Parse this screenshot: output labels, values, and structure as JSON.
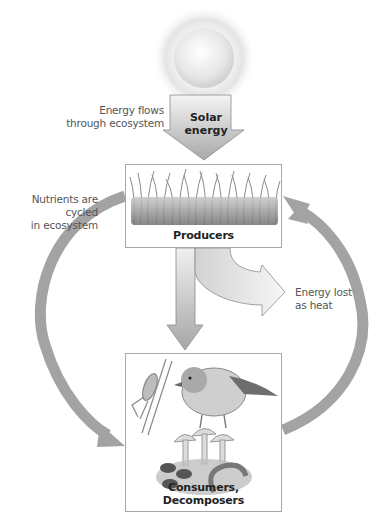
{
  "diagram": {
    "sun": {
      "icon": "sun-icon",
      "label": "Solar\nenergy",
      "label_line1": "Solar",
      "label_line2": "energy"
    },
    "annotations": {
      "energy_flows_line1": "Energy flows",
      "energy_flows_line2": "through ecosystem",
      "nutrients_line1": "Nutrients are cycled",
      "nutrients_line2": "in ecosystem",
      "heat_line1": "Energy lost",
      "heat_line2": "as heat"
    },
    "nodes": {
      "producers": {
        "label": "Producers",
        "illustration": "grass-icon"
      },
      "consumers": {
        "label": "Consumers, Decomposers",
        "illustrations": [
          "grasshopper-icon",
          "bird-icon",
          "mushroom-icon",
          "worm-icon"
        ]
      }
    },
    "arrows": [
      {
        "from": "sun",
        "to": "producers",
        "meaning": "Energy flows through ecosystem"
      },
      {
        "from": "producers",
        "to": "consumers",
        "meaning": "Energy transfer"
      },
      {
        "from": "producers",
        "to": "heat",
        "meaning": "Energy lost as heat"
      },
      {
        "from": "producers",
        "to": "consumers",
        "side": "left",
        "meaning": "Nutrients are cycled in ecosystem"
      },
      {
        "from": "consumers",
        "to": "producers",
        "side": "right",
        "meaning": "Nutrients are cycled in ecosystem"
      }
    ],
    "colors": {
      "arrow_dark": "#9a9a9a",
      "arrow_light": "#e8e8e8",
      "box_border": "#a8a8a8",
      "text": "#555555"
    }
  }
}
